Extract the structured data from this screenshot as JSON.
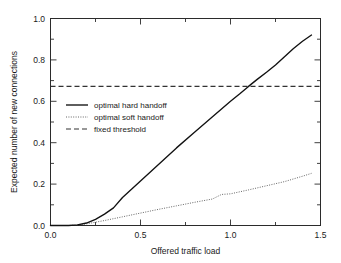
{
  "chart_data": {
    "type": "line",
    "title": "",
    "xlabel": "Offered traffic load",
    "ylabel": "Expected number of new connections",
    "xlim": [
      0.0,
      1.5
    ],
    "ylim": [
      0.0,
      1.0
    ],
    "xticks": [
      "0.0",
      "0.5",
      "1.0",
      "1.5"
    ],
    "xtick_values": [
      0.0,
      0.5,
      1.0,
      1.5
    ],
    "yticks": [
      "0.0",
      "0.2",
      "0.4",
      "0.6",
      "0.8",
      "1.0"
    ],
    "ytick_values": [
      0.0,
      0.2,
      0.4,
      0.6,
      0.8,
      1.0
    ],
    "minor_ticks": true,
    "grid": false,
    "legend_position": "center-left",
    "series": [
      {
        "name": "optimal hard handoff",
        "style": "solid",
        "color": "#111111",
        "x": [
          0.0,
          0.1,
          0.15,
          0.2,
          0.25,
          0.3,
          0.35,
          0.4,
          0.45,
          0.5,
          0.6,
          0.7,
          0.8,
          0.9,
          1.0,
          1.05,
          1.1,
          1.15,
          1.2,
          1.25,
          1.3,
          1.35,
          1.4,
          1.45
        ],
        "y": [
          0.0,
          0.0,
          0.003,
          0.012,
          0.03,
          0.055,
          0.085,
          0.135,
          0.175,
          0.215,
          0.295,
          0.375,
          0.45,
          0.525,
          0.6,
          0.635,
          0.672,
          0.707,
          0.74,
          0.775,
          0.815,
          0.855,
          0.89,
          0.92
        ]
      },
      {
        "name": "optimal soft handoff",
        "style": "dotted",
        "color": "#555555",
        "x": [
          0.0,
          0.1,
          0.15,
          0.2,
          0.25,
          0.3,
          0.4,
          0.5,
          0.6,
          0.7,
          0.8,
          0.9,
          0.95,
          1.0,
          1.1,
          1.2,
          1.3,
          1.4,
          1.45
        ],
        "y": [
          0.0,
          0.0,
          0.002,
          0.008,
          0.016,
          0.024,
          0.042,
          0.06,
          0.078,
          0.095,
          0.112,
          0.128,
          0.15,
          0.153,
          0.172,
          0.192,
          0.212,
          0.238,
          0.252
        ]
      },
      {
        "name": "fixed threshold",
        "style": "dashed",
        "color": "#333333",
        "constant_y": 0.672,
        "x": [
          0.0,
          1.5
        ],
        "y": [
          0.672,
          0.672
        ]
      }
    ],
    "annotations": [
      {
        "text": "hard handoff crosses fixed threshold",
        "x": 1.1,
        "y": 0.672
      }
    ]
  },
  "legend": {
    "items": [
      {
        "label": "optimal hard handoff",
        "style": "solid"
      },
      {
        "label": "optimal soft handoff",
        "style": "dotted"
      },
      {
        "label": "fixed threshold",
        "style": "dashed"
      }
    ]
  },
  "colors": {
    "background": "#ffffff",
    "axis": "#2b2b2b",
    "text": "#1a1a1a",
    "hard": "#111111",
    "soft": "#555555",
    "threshold": "#333333"
  }
}
